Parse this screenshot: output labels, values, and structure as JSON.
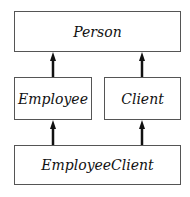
{
  "diagram": {
    "type": "class-inheritance",
    "nodes": [
      {
        "id": "person",
        "label": "Person"
      },
      {
        "id": "employee",
        "label": "Employee"
      },
      {
        "id": "client",
        "label": "Client"
      },
      {
        "id": "employeeclient",
        "label": "EmployeeClient"
      }
    ],
    "edges": [
      {
        "from": "employee",
        "to": "person"
      },
      {
        "from": "client",
        "to": "person"
      },
      {
        "from": "employeeclient",
        "to": "employee"
      },
      {
        "from": "employeeclient",
        "to": "client"
      }
    ],
    "colors": {
      "border": "#555555",
      "arrow": "#111111",
      "background": "#ffffff"
    }
  }
}
